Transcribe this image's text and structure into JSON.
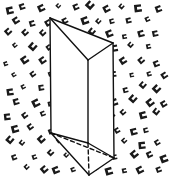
{
  "figure": {
    "canvas": {
      "width": 169,
      "height": 191,
      "background_color": "#ffffff"
    },
    "ink_color": "#111111",
    "face_fill_color": "#ffffff",
    "texture": {
      "glyph_name": "small-open-square-glyph",
      "glyph_color": "#1a1a1a",
      "description": "scattered small rotated open square / C shaped marks in diagonal rows",
      "region": {
        "x": 4,
        "y": 6,
        "width": 160,
        "height": 176
      },
      "rows": 13,
      "cols": 10,
      "spacing_x": 16.5,
      "spacing_y": 13.5,
      "row_offset_x": 8,
      "glyph_size": 6.5,
      "rotation_deg": -28
    },
    "solid": {
      "name": "triangular-prism",
      "vertices": {
        "top_back_left": {
          "x": 50,
          "y": 18
        },
        "top_back_right": {
          "x": 113,
          "y": 43
        },
        "top_front": {
          "x": 88,
          "y": 60
        },
        "bottom_back_left": {
          "x": 51,
          "y": 133
        },
        "bottom_back_right": {
          "x": 114,
          "y": 158
        },
        "bottom_front": {
          "x": 89,
          "y": 175
        },
        "inner_bottom_front": {
          "x": 88,
          "y": 143
        }
      },
      "visible_edges": [
        "top_back_left-top_back_right",
        "top_back_left-top_front",
        "top_front-top_back_right",
        "top_back_left-bottom_back_left",
        "top_front-inner_bottom_front",
        "top_back_right-bottom_back_right",
        "bottom_back_left-inner_bottom_front",
        "inner_bottom_front-bottom_back_right",
        "bottom_back_left-bottom_front",
        "bottom_front-bottom_back_right"
      ],
      "hidden_edges": [
        "bottom_back_left-bottom_back_right",
        "inner_bottom_front-bottom_front"
      ],
      "stroke_width": 1.4,
      "hidden_dash_pattern": "4 3"
    }
  }
}
